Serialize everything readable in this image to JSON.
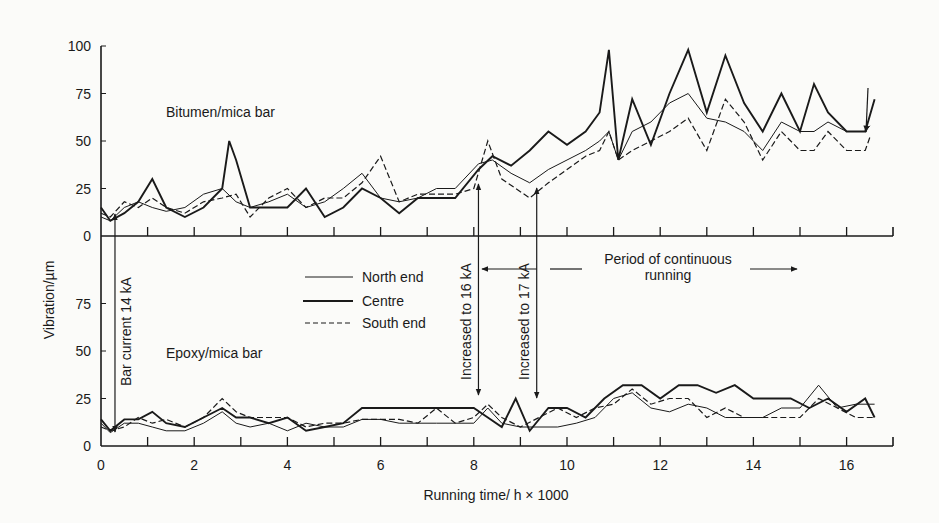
{
  "chart_data": {
    "type": "line",
    "title": "",
    "xlabel": "Running time/ h × 1000",
    "ylabel": "Vibration/µm",
    "xlim": [
      0,
      17
    ],
    "x_ticks": [
      0,
      2,
      4,
      6,
      8,
      10,
      12,
      14,
      16
    ],
    "grid": false,
    "legend": {
      "position": "center-left between panels",
      "entries": [
        {
          "name": "North end",
          "style": "thin solid"
        },
        {
          "name": "Centre",
          "style": "thick solid"
        },
        {
          "name": "South end",
          "style": "dashed"
        }
      ]
    },
    "panels": [
      {
        "name": "Bitumen/mica bar",
        "ylim": [
          0,
          100
        ],
        "y_ticks": [
          0,
          25,
          50,
          75,
          100
        ],
        "series": [
          {
            "name": "North end",
            "x": [
              0,
              0.2,
              0.5,
              0.8,
              1.1,
              1.4,
              1.8,
              2.2,
              2.6,
              2.9,
              3.2,
              3.6,
              4.0,
              4.4,
              4.8,
              5.2,
              5.6,
              6.0,
              6.4,
              6.8,
              7.2,
              7.6,
              8.1,
              8.4,
              8.8,
              9.2,
              9.6,
              10.0,
              10.4,
              10.7,
              10.9,
              11.1,
              11.4,
              11.8,
              12.2,
              12.6,
              13.0,
              13.4,
              13.8,
              14.2,
              14.6,
              15.0,
              15.3,
              15.6,
              16.0,
              16.4,
              16.5
            ],
            "y": [
              10,
              8,
              15,
              18,
              15,
              13,
              15,
              22,
              25,
              18,
              15,
              18,
              22,
              15,
              18,
              25,
              33,
              20,
              18,
              20,
              25,
              25,
              38,
              40,
              33,
              28,
              35,
              40,
              45,
              50,
              55,
              40,
              55,
              60,
              70,
              75,
              62,
              60,
              55,
              45,
              60,
              55,
              55,
              60,
              55,
              55,
              58
            ]
          },
          {
            "name": "Centre",
            "x": [
              0,
              0.2,
              0.5,
              0.8,
              1.1,
              1.4,
              1.8,
              2.2,
              2.6,
              2.75,
              2.9,
              3.2,
              3.6,
              4.0,
              4.4,
              4.8,
              5.2,
              5.6,
              6.0,
              6.4,
              6.8,
              7.2,
              7.6,
              8.1,
              8.4,
              8.8,
              9.2,
              9.6,
              10.0,
              10.4,
              10.7,
              10.9,
              11.1,
              11.4,
              11.8,
              12.2,
              12.6,
              13.0,
              13.4,
              13.8,
              14.2,
              14.6,
              15.0,
              15.3,
              15.6,
              16.0,
              16.4,
              16.6
            ],
            "y": [
              15,
              8,
              12,
              18,
              30,
              15,
              10,
              15,
              25,
              50,
              40,
              15,
              15,
              15,
              25,
              10,
              15,
              25,
              20,
              12,
              20,
              20,
              20,
              35,
              42,
              37,
              45,
              55,
              48,
              55,
              65,
              98,
              40,
              72,
              48,
              75,
              98,
              65,
              95,
              70,
              55,
              75,
              55,
              80,
              65,
              55,
              55,
              72
            ]
          },
          {
            "name": "South end",
            "x": [
              0,
              0.2,
              0.5,
              0.8,
              1.1,
              1.4,
              1.8,
              2.2,
              2.6,
              2.9,
              3.2,
              3.6,
              4.0,
              4.4,
              4.8,
              5.2,
              5.6,
              6.0,
              6.4,
              6.8,
              7.2,
              7.6,
              8.0,
              8.3,
              8.6,
              9.2,
              9.6,
              10.0,
              10.4,
              10.7,
              10.9,
              11.1,
              11.4,
              11.8,
              12.2,
              12.6,
              13.0,
              13.4,
              13.8,
              14.2,
              14.6,
              15.0,
              15.3,
              15.6,
              16.0,
              16.4,
              16.5
            ],
            "y": [
              12,
              10,
              18,
              15,
              20,
              15,
              12,
              18,
              20,
              22,
              10,
              20,
              25,
              15,
              20,
              20,
              28,
              42,
              18,
              22,
              22,
              22,
              25,
              50,
              30,
              20,
              28,
              35,
              42,
              45,
              55,
              40,
              45,
              50,
              55,
              62,
              45,
              72,
              60,
              40,
              55,
              45,
              45,
              55,
              45,
              45,
              52
            ]
          }
        ],
        "annotations": [
          {
            "text": "Bar current 14 kA",
            "x": 0.3,
            "orientation": "vertical",
            "arrow": "up into upper panel / down into lower panel"
          },
          {
            "text": "Increased to 16 kA",
            "x": 8.1,
            "orientation": "vertical"
          },
          {
            "text": "Increased to 17 kA",
            "x": 9.35,
            "orientation": "vertical"
          },
          {
            "text": "Period of continuous running",
            "x_range": [
              8.2,
              15.0
            ],
            "arrows": "both directions"
          }
        ]
      },
      {
        "name": "Epoxy/mica bar",
        "ylim": [
          0,
          100
        ],
        "y_ticks": [
          0,
          25,
          50,
          75
        ],
        "series": [
          {
            "name": "North end",
            "x": [
              0,
              0.2,
              0.5,
              0.8,
              1.1,
              1.4,
              1.8,
              2.2,
              2.6,
              2.9,
              3.2,
              3.6,
              4.0,
              4.4,
              4.8,
              5.2,
              5.6,
              6.0,
              6.4,
              6.8,
              7.2,
              7.6,
              8.0,
              8.3,
              8.6,
              9.0,
              9.4,
              9.8,
              10.2,
              10.6,
              11.0,
              11.4,
              11.8,
              12.2,
              12.6,
              13.0,
              13.4,
              13.8,
              14.2,
              14.6,
              15.0,
              15.4,
              15.8,
              16.2,
              16.6
            ],
            "y": [
              12,
              7,
              12,
              12,
              10,
              8,
              8,
              12,
              18,
              12,
              10,
              12,
              8,
              12,
              10,
              10,
              14,
              14,
              12,
              12,
              12,
              12,
              12,
              20,
              12,
              10,
              10,
              10,
              12,
              15,
              25,
              28,
              20,
              18,
              22,
              20,
              15,
              15,
              15,
              20,
              20,
              32,
              20,
              22,
              22
            ]
          },
          {
            "name": "Centre",
            "x": [
              0,
              0.2,
              0.5,
              0.8,
              1.1,
              1.4,
              1.8,
              2.2,
              2.6,
              2.9,
              3.2,
              3.6,
              4.0,
              4.4,
              4.8,
              5.2,
              5.6,
              6.0,
              6.4,
              6.8,
              7.2,
              7.6,
              8.0,
              8.3,
              8.6,
              8.9,
              9.2,
              9.6,
              10.0,
              10.4,
              10.8,
              11.2,
              11.6,
              12.0,
              12.4,
              12.8,
              13.2,
              13.6,
              14.0,
              14.4,
              14.8,
              15.2,
              15.6,
              16.0,
              16.4,
              16.6
            ],
            "y": [
              14,
              8,
              14,
              14,
              18,
              12,
              10,
              15,
              20,
              15,
              15,
              12,
              15,
              8,
              10,
              12,
              20,
              20,
              20,
              20,
              20,
              20,
              20,
              15,
              10,
              25,
              8,
              20,
              20,
              15,
              25,
              32,
              32,
              25,
              32,
              32,
              28,
              32,
              25,
              25,
              25,
              20,
              25,
              18,
              25,
              15
            ]
          },
          {
            "name": "South end",
            "x": [
              0,
              0.2,
              0.5,
              0.8,
              1.1,
              1.4,
              1.8,
              2.2,
              2.6,
              2.9,
              3.2,
              3.6,
              4.0,
              4.4,
              4.8,
              5.2,
              5.6,
              6.0,
              6.4,
              6.8,
              7.2,
              7.6,
              8.0,
              8.3,
              8.6,
              9.0,
              9.4,
              9.8,
              10.2,
              10.6,
              11.0,
              11.4,
              11.8,
              12.2,
              12.6,
              13.0,
              13.4,
              13.8,
              14.2,
              14.6,
              15.0,
              15.4,
              15.8,
              16.2,
              16.6
            ],
            "y": [
              10,
              8,
              10,
              15,
              12,
              14,
              10,
              15,
              25,
              18,
              15,
              15,
              15,
              10,
              12,
              12,
              14,
              14,
              14,
              12,
              20,
              12,
              15,
              22,
              15,
              10,
              15,
              20,
              15,
              20,
              22,
              30,
              22,
              25,
              25,
              15,
              20,
              15,
              15,
              15,
              15,
              25,
              20,
              15,
              15
            ]
          }
        ]
      }
    ]
  },
  "labels": {
    "panel_upper": "Bitumen/mica bar",
    "panel_lower": "Epoxy/mica bar",
    "ylabel": "Vibration/µm",
    "xlabel": "Running time/ h × 1000",
    "bar_current": "Bar current  14 kA",
    "inc16": "Increased to 16 kA",
    "inc17": "Increased to 17 kA",
    "period_line1": "Period of continuous",
    "period_line2": "running",
    "legend_north": "North end",
    "legend_centre": "Centre",
    "legend_south": "South end"
  }
}
